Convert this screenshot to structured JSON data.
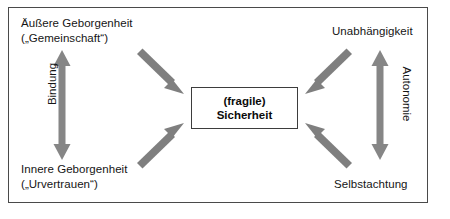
{
  "diagram": {
    "title_box": {
      "line1": "(fragile)",
      "line2": "Sicherheit"
    },
    "corner_labels": {
      "top_left_line1": "Äußere Geborgenheit",
      "top_left_line2": "(„Gemeinschaft“)",
      "bottom_left_line1": "Innere Geborgenheit",
      "bottom_left_line2": "(„Urvertrauen“)",
      "top_right": "Unabhängigkeit",
      "bottom_right": "Selbstachtung"
    },
    "axis_labels": {
      "left": "Bindung",
      "right": "Autonomie"
    },
    "colors": {
      "arrow": "#808080",
      "arrow_dark": "#6e6e6e",
      "frame_border": "#4a4a4a",
      "box_border": "#3d3d3d",
      "text": "#151515",
      "background": "#ffffff"
    },
    "arrows": {
      "top_left_diagonal": "arrow-down-right-icon",
      "bottom_left_diagonal": "arrow-up-right-icon",
      "top_right_diagonal": "arrow-down-left-icon",
      "bottom_right_diagonal": "arrow-up-left-icon",
      "left_vertical": "double-arrow-vertical-icon",
      "right_vertical": "double-arrow-vertical-icon"
    }
  }
}
